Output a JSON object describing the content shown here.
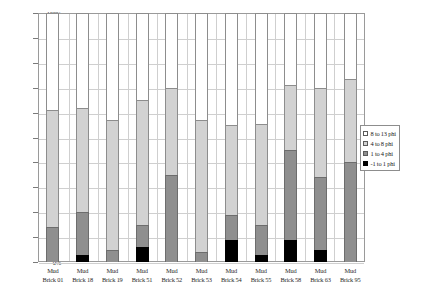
{
  "chart_data": {
    "type": "bar",
    "stacked": true,
    "title": "",
    "subtitle": "",
    "xlabel": "",
    "ylabel": "",
    "ylim": [
      0,
      100
    ],
    "ytick_labels": [
      "100%",
      "90%",
      "80%",
      "70%",
      "60%",
      "50%",
      "40%",
      "30%",
      "20%",
      "10%",
      "0%"
    ],
    "ytick_values": [
      100,
      90,
      80,
      70,
      60,
      50,
      40,
      30,
      20,
      10,
      0
    ],
    "grid": true,
    "legend_position": "right",
    "categories": [
      "Mud Brick 01",
      "Mud Brick 18",
      "Mud Brick 19",
      "Mud Brick 51",
      "Mud Brick 52",
      "Mud Brick 53",
      "Mud Brick 54",
      "Mud Brick 55",
      "Mud Brick 58",
      "Mud Brick 63",
      "Mud Brick 95"
    ],
    "category_lines": [
      [
        "Mud",
        "Brick 01"
      ],
      [
        "Mud",
        "Brick 18"
      ],
      [
        "Mud",
        "Brick 19"
      ],
      [
        "Mud",
        "Brick 51"
      ],
      [
        "Mud",
        "Brick 52"
      ],
      [
        "Mud",
        "Brick 53"
      ],
      [
        "Mud",
        "Brick 54"
      ],
      [
        "Mud",
        "Brick 55"
      ],
      [
        "Mud",
        "Brick 58"
      ],
      [
        "Mud",
        "Brick 63"
      ],
      [
        "Mud",
        "Brick 95"
      ]
    ],
    "series": [
      {
        "name": "8 to 13 phi",
        "color": "#ffffff",
        "values": [
          39.0,
          38.0,
          43.0,
          35.0,
          30.0,
          43.0,
          45.0,
          44.5,
          29.0,
          30.0,
          26.5
        ]
      },
      {
        "name": "4 to 8 phi",
        "color": "#d2d2d2",
        "values": [
          47.0,
          42.0,
          52.0,
          50.0,
          35.0,
          53.0,
          36.0,
          40.5,
          26.0,
          36.0,
          33.5
        ]
      },
      {
        "name": "1 to 4 phi",
        "color": "#8f8f8f",
        "values": [
          14.0,
          17.0,
          5.0,
          9.0,
          35.0,
          4.0,
          10.0,
          12.0,
          36.0,
          29.0,
          40.0
        ]
      },
      {
        "name": "-1 to 1 phi",
        "color": "#000000",
        "values": [
          0.0,
          3.0,
          0.0,
          6.0,
          0.0,
          0.0,
          9.0,
          3.0,
          9.0,
          5.0,
          0.0
        ]
      }
    ],
    "stack_tops": {
      "comment_free": [
        {
          "category": "Mud Brick 01",
          "d": 0.0,
          "c": 14.0,
          "b": 61.0,
          "a": 100.0
        },
        {
          "category": "Mud Brick 18",
          "d": 3.0,
          "c": 20.0,
          "b": 62.0,
          "a": 100.0
        },
        {
          "category": "Mud Brick 19",
          "d": 0.0,
          "c": 5.0,
          "b": 57.0,
          "a": 100.0
        },
        {
          "category": "Mud Brick 51",
          "d": 6.0,
          "c": 15.0,
          "b": 65.0,
          "a": 100.0
        },
        {
          "category": "Mud Brick 52",
          "d": 0.0,
          "c": 35.0,
          "b": 70.0,
          "a": 100.0
        },
        {
          "category": "Mud Brick 53",
          "d": 0.0,
          "c": 4.0,
          "b": 57.0,
          "a": 100.0
        },
        {
          "category": "Mud Brick 54",
          "d": 9.0,
          "c": 19.0,
          "b": 55.0,
          "a": 100.0
        },
        {
          "category": "Mud Brick 55",
          "d": 3.0,
          "c": 15.0,
          "b": 55.5,
          "a": 100.0
        },
        {
          "category": "Mud Brick 58",
          "d": 9.0,
          "c": 45.0,
          "b": 71.0,
          "a": 100.0
        },
        {
          "category": "Mud Brick 63",
          "d": 5.0,
          "c": 34.0,
          "b": 70.0,
          "a": 100.0
        },
        {
          "category": "Mud Brick 95",
          "d": 0.0,
          "c": 40.0,
          "b": 73.5,
          "a": 100.0
        }
      ]
    },
    "legend": [
      {
        "label": "8 to 13 phi",
        "swatch": "white"
      },
      {
        "label": "4 to 8 phi",
        "swatch": "light-gray"
      },
      {
        "label": "1 to 4 phi",
        "swatch": "medium-gray"
      },
      {
        "label": "-1 to 1 phi",
        "swatch": "black"
      }
    ]
  },
  "colors": {
    "axis": "#9a9a9a",
    "grid": "#cfcfcf",
    "text": "#1a1a1a",
    "series_a": "#ffffff",
    "series_b": "#d2d2d2",
    "series_c": "#8f8f8f",
    "series_d": "#000000"
  }
}
